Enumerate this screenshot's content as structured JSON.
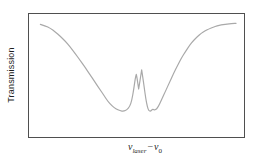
{
  "chart_data": {
    "type": "line",
    "title": "",
    "ylabel": "Transmission",
    "xlabel": "ν_laser − ν_0",
    "xlabel_parts": {
      "sym1": "ν",
      "sub1": "laser",
      "op": "−",
      "sym2": "ν",
      "sub2": "0"
    },
    "grid": false,
    "axis_ticks": false,
    "legend": false,
    "background_color": "#ffffff",
    "frame_color": "#4f4f4f",
    "curve_color": "#a9a9a9",
    "text_color": "#1f1f1f",
    "x_axis_units": "arbitrary detuning (unlabeled)",
    "y_axis_units": "arbitrary transmission (unlabeled)",
    "series": [
      {
        "name": "transmission-curve",
        "points": [
          [
            0.053,
            0.916
          ],
          [
            0.076,
            0.904
          ],
          [
            0.099,
            0.884
          ],
          [
            0.122,
            0.855
          ],
          [
            0.145,
            0.819
          ],
          [
            0.169,
            0.779
          ],
          [
            0.192,
            0.731
          ],
          [
            0.215,
            0.679
          ],
          [
            0.238,
            0.622
          ],
          [
            0.261,
            0.566
          ],
          [
            0.284,
            0.506
          ],
          [
            0.307,
            0.446
          ],
          [
            0.33,
            0.386
          ],
          [
            0.349,
            0.337
          ],
          [
            0.367,
            0.289
          ],
          [
            0.386,
            0.253
          ],
          [
            0.404,
            0.229
          ],
          [
            0.423,
            0.213
          ],
          [
            0.441,
            0.209
          ],
          [
            0.455,
            0.221
          ],
          [
            0.469,
            0.249
          ],
          [
            0.478,
            0.297
          ],
          [
            0.487,
            0.386
          ],
          [
            0.494,
            0.474
          ],
          [
            0.499,
            0.51
          ],
          [
            0.499,
            0.51
          ],
          [
            0.503,
            0.474
          ],
          [
            0.51,
            0.39
          ],
          [
            0.51,
            0.39
          ],
          [
            0.517,
            0.466
          ],
          [
            0.524,
            0.546
          ],
          [
            0.524,
            0.546
          ],
          [
            0.529,
            0.49
          ],
          [
            0.536,
            0.402
          ],
          [
            0.543,
            0.313
          ],
          [
            0.55,
            0.249
          ],
          [
            0.557,
            0.213
          ],
          [
            0.566,
            0.209
          ],
          [
            0.575,
            0.229
          ],
          [
            0.584,
            0.217
          ],
          [
            0.594,
            0.229
          ],
          [
            0.603,
            0.253
          ],
          [
            0.617,
            0.305
          ],
          [
            0.635,
            0.373
          ],
          [
            0.654,
            0.446
          ],
          [
            0.672,
            0.514
          ],
          [
            0.691,
            0.582
          ],
          [
            0.709,
            0.643
          ],
          [
            0.728,
            0.695
          ],
          [
            0.746,
            0.743
          ],
          [
            0.764,
            0.783
          ],
          [
            0.783,
            0.815
          ],
          [
            0.801,
            0.843
          ],
          [
            0.82,
            0.863
          ],
          [
            0.838,
            0.88
          ],
          [
            0.857,
            0.893
          ],
          [
            0.875,
            0.904
          ],
          [
            0.894,
            0.911
          ],
          [
            0.912,
            0.916
          ],
          [
            0.931,
            0.92
          ],
          [
            0.951,
            0.923
          ],
          [
            0.963,
            0.924
          ]
        ]
      }
    ]
  }
}
